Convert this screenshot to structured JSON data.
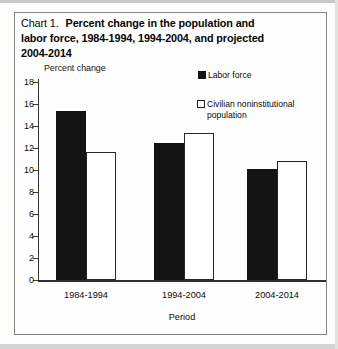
{
  "colors": {
    "bar_labor_force": "#141414",
    "bar_population_fill": "#ffffff",
    "bar_population_outline": "#262626",
    "axis": "#343434",
    "frame_border": "#838383",
    "text": "#000000",
    "page_background": "#fdfdfc"
  },
  "labels": {
    "figure_label": "Chart 1.",
    "title_line1": "Percent change in the population and",
    "title_line2": "labor force, 1984-1994, 1994-2004, and projected",
    "title_line3": "2004-2014"
  },
  "chart_data": {
    "type": "bar",
    "categories": [
      "1984-1994",
      "1994-2004",
      "2004-2014"
    ],
    "series": [
      {
        "name": "Labor force",
        "values": [
          15.4,
          12.5,
          10.1
        ],
        "style": "solid-black"
      },
      {
        "name": "Civilian noninstitutional population",
        "values": [
          11.6,
          13.4,
          10.8
        ],
        "style": "white-outlined"
      }
    ],
    "xlabel": "Period",
    "ylabel": "Percent change",
    "ylim": [
      0,
      18
    ],
    "ytick_step": 2,
    "ytick_labels": [
      "0",
      "2",
      "4",
      "6",
      "8",
      "10",
      "12",
      "14",
      "16",
      "18"
    ],
    "grid": false,
    "legend_position": "upper-right-inside"
  }
}
